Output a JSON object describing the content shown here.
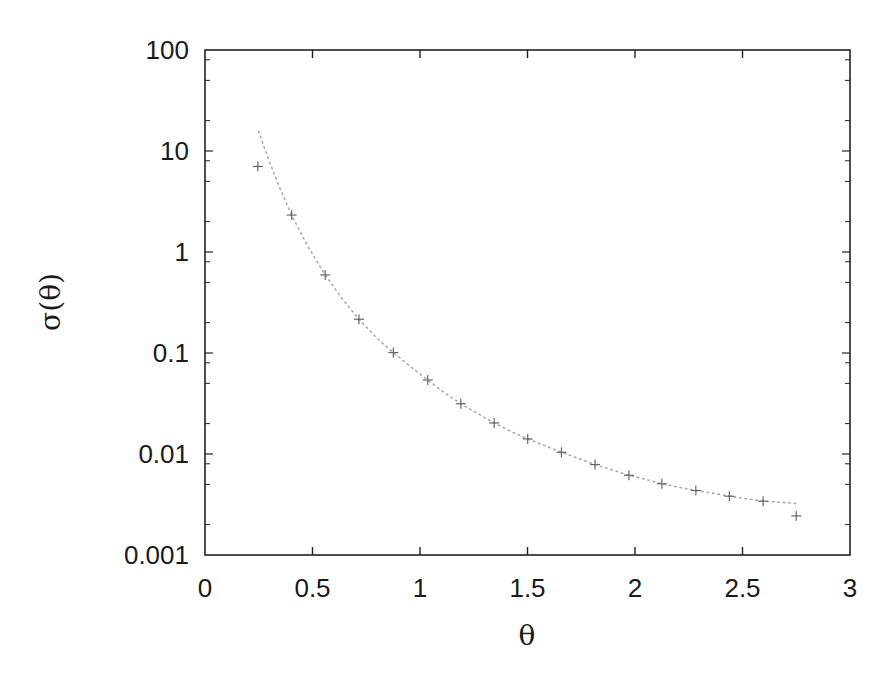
{
  "chart_data": {
    "type": "scatter",
    "title": "",
    "xlabel": "θ",
    "ylabel": "σ(θ)",
    "xlim": [
      0,
      3
    ],
    "ylim": [
      0.001,
      100
    ],
    "yscale": "log",
    "grid": false,
    "legend": null,
    "x_ticks": [
      {
        "value": 0,
        "label": "0"
      },
      {
        "value": 0.5,
        "label": "0.5"
      },
      {
        "value": 1,
        "label": "1"
      },
      {
        "value": 1.5,
        "label": "1.5"
      },
      {
        "value": 2,
        "label": "2"
      },
      {
        "value": 2.5,
        "label": "2.5"
      },
      {
        "value": 3,
        "label": "3"
      }
    ],
    "y_ticks": [
      {
        "value": 100,
        "label": "100"
      },
      {
        "value": 10,
        "label": "10"
      },
      {
        "value": 1,
        "label": "1"
      },
      {
        "value": 0.1,
        "label": "0.1"
      },
      {
        "value": 0.01,
        "label": "0.01"
      },
      {
        "value": 0.001,
        "label": "0.001"
      }
    ],
    "series": [
      {
        "name": "data points",
        "style": "crosses",
        "color": "#666666",
        "x": [
          0.246,
          0.403,
          0.559,
          0.716,
          0.876,
          1.036,
          1.19,
          1.345,
          1.501,
          1.658,
          1.814,
          1.972,
          2.125,
          2.283,
          2.439,
          2.596,
          2.75
        ],
        "y": [
          7.03,
          2.32,
          0.593,
          0.216,
          0.101,
          0.054,
          0.0315,
          0.0203,
          0.0141,
          0.0104,
          0.00786,
          0.00615,
          0.00507,
          0.00435,
          0.00382,
          0.00341,
          0.00244
        ]
      },
      {
        "name": "fit curve",
        "style": "dotted-line",
        "color": "#aaaaaa",
        "x": [
          0.249,
          0.3,
          0.35,
          0.403,
          0.48,
          0.559,
          0.64,
          0.716,
          0.8,
          0.876,
          0.96,
          1.036,
          1.11,
          1.19,
          1.27,
          1.345,
          1.42,
          1.501,
          1.58,
          1.658,
          1.74,
          1.814,
          1.89,
          1.972,
          2.05,
          2.125,
          2.2,
          2.283,
          2.36,
          2.439,
          2.52,
          2.596,
          2.67,
          2.75
        ],
        "y": [
          15.7,
          7.8,
          4.2,
          2.32,
          1.12,
          0.593,
          0.34,
          0.216,
          0.14,
          0.101,
          0.072,
          0.054,
          0.041,
          0.0315,
          0.025,
          0.0203,
          0.0168,
          0.0141,
          0.0121,
          0.0104,
          0.009,
          0.00786,
          0.007,
          0.00615,
          0.0056,
          0.00507,
          0.0047,
          0.00435,
          0.0041,
          0.00382,
          0.0036,
          0.00341,
          0.00333,
          0.00324
        ]
      }
    ]
  },
  "plot_area": {
    "left": 205,
    "top": 50,
    "right": 850,
    "bottom": 555
  },
  "colors": {
    "axis": "#222222",
    "points": "#666666",
    "curve": "#aaaaaa",
    "text": "#1a1a1a"
  }
}
